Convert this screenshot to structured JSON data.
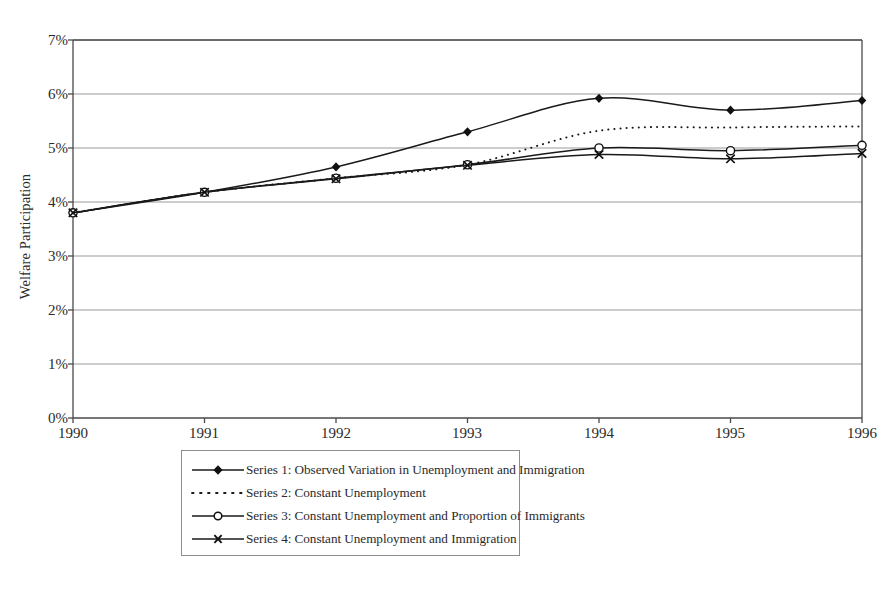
{
  "chart_data": {
    "type": "line",
    "title": "",
    "xlabel": "",
    "ylabel": "Welfare Participation",
    "categories": [
      "1990",
      "1991",
      "1992",
      "1993",
      "1994",
      "1995",
      "1996"
    ],
    "x": [
      1990,
      1991,
      1992,
      1993,
      1994,
      1995,
      1996
    ],
    "xlim": [
      1990,
      1996
    ],
    "ylim": [
      0,
      7
    ],
    "ytick_values": [
      0,
      1,
      2,
      3,
      4,
      5,
      6,
      7
    ],
    "ytick_labels": [
      "0%",
      "1%",
      "2%",
      "3%",
      "4%",
      "5%",
      "6%",
      "7%"
    ],
    "grid": true,
    "grid_axis": "y",
    "legend_position": "below-center",
    "units": "percent",
    "series": [
      {
        "name": "Series 1: Observed Variation in Unemployment and Immigration",
        "short_name": "Series 1",
        "marker": "filled-diamond",
        "line_style": "solid",
        "values": [
          3.8,
          4.18,
          4.65,
          5.3,
          5.92,
          5.7,
          5.88
        ]
      },
      {
        "name": "Series 2: Constant Unemployment",
        "short_name": "Series 2",
        "marker": "none",
        "line_style": "dotted",
        "values": [
          3.8,
          4.18,
          4.44,
          4.69,
          5.32,
          5.38,
          5.4
        ]
      },
      {
        "name": "Series 3: Constant Unemployment and Proportion of Immigrants",
        "short_name": "Series 3",
        "marker": "open-circle",
        "line_style": "solid",
        "values": [
          3.8,
          4.18,
          4.44,
          4.69,
          5.0,
          4.95,
          5.05
        ]
      },
      {
        "name": "Series 4: Constant Unemployment and Immigration",
        "short_name": "Series 4",
        "marker": "cross-x",
        "line_style": "solid",
        "values": [
          3.8,
          4.18,
          4.43,
          4.68,
          4.88,
          4.8,
          4.9
        ]
      }
    ],
    "colors": {
      "line": "#1a1a1a",
      "grid": "#9a9a9a",
      "axis": "#555555",
      "background": "#ffffff",
      "text": "#2a2a2a"
    }
  }
}
